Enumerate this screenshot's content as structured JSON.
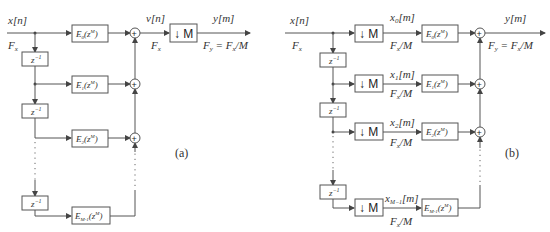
{
  "panel_a": {
    "caption": "(a)",
    "input_signal": "x[n]",
    "input_rate": "F_x",
    "delay_label": "z^-1",
    "branches": [
      "E_0(z^M)",
      "E_1(z^M)",
      "E_2(z^M)",
      "E_M-1(z^M)"
    ],
    "sum_output": "v[n]",
    "sum_rate": "F_x",
    "decimator": "↓ M",
    "output_signal": "y[m]",
    "output_rate": "F_y = F_x/M"
  },
  "panel_b": {
    "caption": "(b)",
    "input_signal": "x[n]",
    "input_rate": "F_x",
    "delay_label": "z^-1",
    "decimator": "↓ M",
    "phases": [
      "x_0[m]",
      "x_1[m]",
      "x_2[m]",
      "x_M-1[m]"
    ],
    "phase_rate": "F_x/M",
    "branches": [
      "E_0(z^M)",
      "E_1(z^M)",
      "E_2(z^M)",
      "E_M-1(z^M)"
    ],
    "output_signal": "y[m]",
    "output_rate": "F_y = F_x/M"
  }
}
